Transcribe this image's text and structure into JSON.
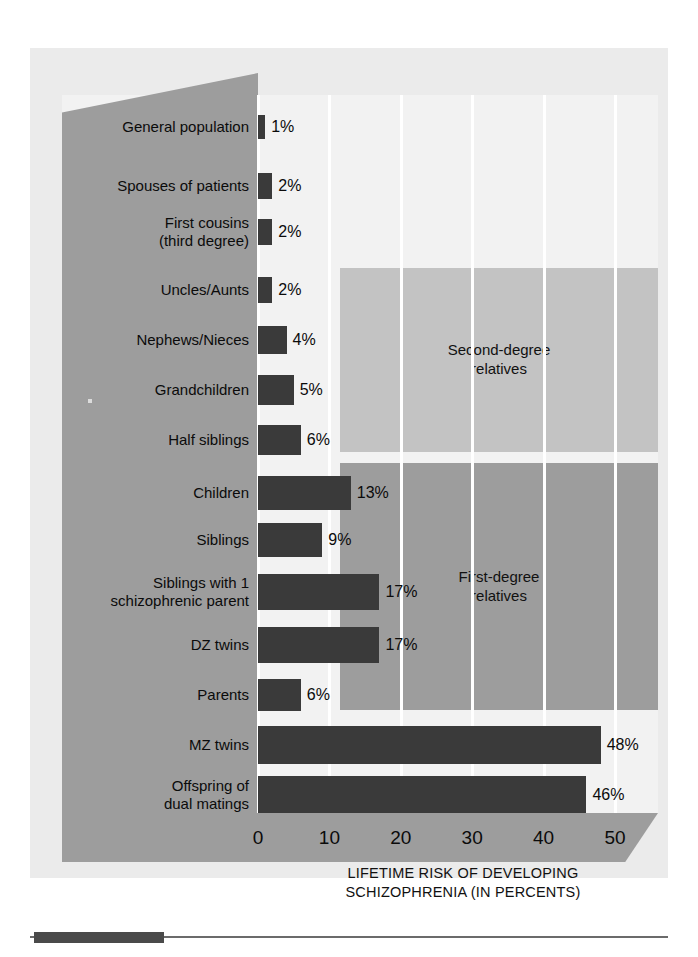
{
  "figure": {
    "axis_title_line1": "LIFETIME RISK OF DEVELOPING",
    "axis_title_line2": "SCHIZOPHRENIA (IN PERCENTS)",
    "group_second_label": "Second-degree\nrelatives",
    "group_second_line1": "Second-degree",
    "group_second_line2": "relatives",
    "group_first_line1": "First-degree",
    "group_first_line2": "relatives",
    "colors": {
      "bar": "#3a3a3a",
      "panel": "#9d9d9d",
      "group_second": "#c3c3c3",
      "group_first": "#9d9d9d",
      "plot_background": "#f2f2f2",
      "frame": "#ebebeb",
      "gridline": "#ffffff"
    }
  },
  "chart_data": {
    "type": "bar",
    "orientation": "horizontal",
    "title": "",
    "xlabel": "LIFETIME RISK OF DEVELOPING SCHIZOPHRENIA (IN PERCENTS)",
    "ylabel": "",
    "xlim": [
      0,
      50
    ],
    "xticks": [
      0,
      10,
      20,
      30,
      40,
      50
    ],
    "xtick_labels": [
      "0",
      "10",
      "20",
      "30",
      "40",
      "50"
    ],
    "grid": true,
    "legend": [
      "Second-degree relatives",
      "First-degree relatives"
    ],
    "legend_position": "inside-right-blocks",
    "value_label_suffix": "%",
    "categories": [
      "General population",
      "Spouses of patients",
      "First cousins (third degree)",
      "Uncles/Aunts",
      "Nephews/Nieces",
      "Grandchildren",
      "Half siblings",
      "Children",
      "Siblings",
      "Siblings with 1 schizophrenic parent",
      "DZ twins",
      "Parents",
      "MZ twins",
      "Offspring of dual matings"
    ],
    "values": [
      1,
      2,
      2,
      2,
      4,
      5,
      6,
      13,
      9,
      17,
      17,
      6,
      48,
      46
    ],
    "value_labels": [
      "1%",
      "2%",
      "2%",
      "2%",
      "4%",
      "5%",
      "6%",
      "13%",
      "9%",
      "17%",
      "17%",
      "6%",
      "48%",
      "46%"
    ],
    "rows": [
      {
        "label_line1": "General population",
        "label_line2": "",
        "value": 1,
        "label": "1%",
        "group": "none"
      },
      {
        "label_line1": "Spouses of patients",
        "label_line2": "",
        "value": 2,
        "label": "2%",
        "group": "none"
      },
      {
        "label_line1": "First cousins",
        "label_line2": "(third degree)",
        "value": 2,
        "label": "2%",
        "group": "none"
      },
      {
        "label_line1": "Uncles/Aunts",
        "label_line2": "",
        "value": 2,
        "label": "2%",
        "group": "second-degree"
      },
      {
        "label_line1": "Nephews/Nieces",
        "label_line2": "",
        "value": 4,
        "label": "4%",
        "group": "second-degree"
      },
      {
        "label_line1": "Grandchildren",
        "label_line2": "",
        "value": 5,
        "label": "5%",
        "group": "second-degree"
      },
      {
        "label_line1": "Half siblings",
        "label_line2": "",
        "value": 6,
        "label": "6%",
        "group": "second-degree"
      },
      {
        "label_line1": "Children",
        "label_line2": "",
        "value": 13,
        "label": "13%",
        "group": "first-degree"
      },
      {
        "label_line1": "Siblings",
        "label_line2": "",
        "value": 9,
        "label": "9%",
        "group": "first-degree"
      },
      {
        "label_line1": "Siblings with 1",
        "label_line2": "schizophrenic parent",
        "value": 17,
        "label": "17%",
        "group": "first-degree"
      },
      {
        "label_line1": "DZ twins",
        "label_line2": "",
        "value": 17,
        "label": "17%",
        "group": "first-degree"
      },
      {
        "label_line1": "Parents",
        "label_line2": "",
        "value": 6,
        "label": "6%",
        "group": "first-degree"
      },
      {
        "label_line1": "MZ twins",
        "label_line2": "",
        "value": 48,
        "label": "48%",
        "group": "none"
      },
      {
        "label_line1": "Offspring of",
        "label_line2": "dual matings",
        "value": 46,
        "label": "46%",
        "group": "none"
      }
    ]
  }
}
